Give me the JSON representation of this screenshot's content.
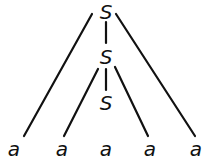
{
  "diagram": {
    "type": "parse-tree",
    "nodes": [
      {
        "id": "n1",
        "label": "S",
        "x": 106,
        "y": 19
      },
      {
        "id": "n2",
        "label": "S",
        "x": 106,
        "y": 64
      },
      {
        "id": "n3",
        "label": "S",
        "x": 106,
        "y": 110
      },
      {
        "id": "l1",
        "label": "a",
        "x": 14,
        "y": 156
      },
      {
        "id": "l2",
        "label": "a",
        "x": 62,
        "y": 156
      },
      {
        "id": "l3",
        "label": "a",
        "x": 106,
        "y": 156
      },
      {
        "id": "l4",
        "label": "a",
        "x": 150,
        "y": 156
      },
      {
        "id": "l5",
        "label": "a",
        "x": 196,
        "y": 156
      }
    ],
    "edges": [
      {
        "from": "n1",
        "to": "l1"
      },
      {
        "from": "n1",
        "to": "n2"
      },
      {
        "from": "n1",
        "to": "l5"
      },
      {
        "from": "n2",
        "to": "l2"
      },
      {
        "from": "n2",
        "to": "n3"
      },
      {
        "from": "n2",
        "to": "l4"
      }
    ]
  }
}
